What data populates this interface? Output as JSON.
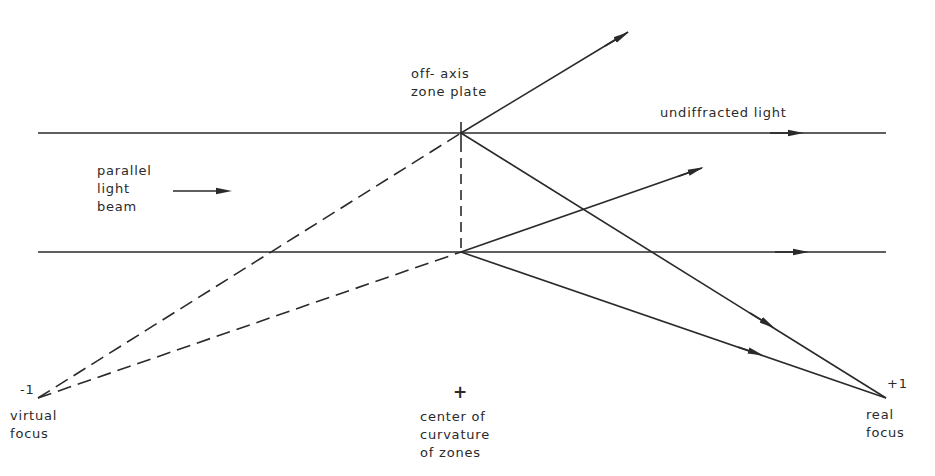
{
  "diagram": {
    "type": "optics-ray-diagram",
    "labels": {
      "zone_plate": [
        "off- axis",
        "zone plate"
      ],
      "undiffracted": "undiffracted light",
      "beam": [
        "parallel",
        "light",
        "beam"
      ],
      "virtual_order": "-1",
      "virtual_focus": [
        "virtual",
        "focus"
      ],
      "center_mark": "+",
      "center": [
        "center of",
        "curvature",
        "of zones"
      ],
      "real_order": "+1",
      "real_focus": [
        "real",
        "focus"
      ]
    },
    "colors": {
      "ink": "#2a2a2a",
      "background": "#ffffff"
    }
  }
}
